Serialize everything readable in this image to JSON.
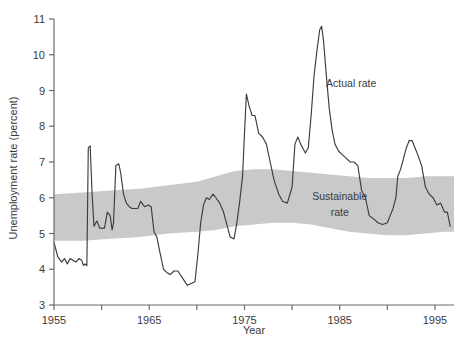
{
  "chart_data": {
    "type": "line",
    "title": "",
    "xlabel": "Year",
    "ylabel": "Unemployment rate (percent)",
    "xlim": [
      1955,
      1997
    ],
    "ylim": [
      3,
      11
    ],
    "xticks": [
      1955,
      1960,
      1965,
      1970,
      1975,
      1980,
      1985,
      1990,
      1995
    ],
    "xticklabels": [
      "1955",
      "",
      "1965",
      "",
      "1975",
      "",
      "1985",
      "",
      "1995"
    ],
    "yticks": [
      3,
      4,
      5,
      6,
      7,
      8,
      9,
      10,
      11
    ],
    "yticklabels": [
      "3",
      "4",
      "5",
      "6",
      "7",
      "8",
      "9",
      "10",
      "11"
    ],
    "grid": false,
    "legend_position": "inline-annotations",
    "annotations": [
      {
        "name": "actual-rate-label",
        "text": "Actual rate",
        "x": 1986.2,
        "y": 9.1
      },
      {
        "name": "sustainable-rate-label-line1",
        "text": "Sustainable",
        "x": 1985.0,
        "y": 5.95
      },
      {
        "name": "sustainable-rate-label-line2",
        "text": "rate",
        "x": 1985.0,
        "y": 5.5
      }
    ],
    "colors": {
      "line": "#3c3c3c",
      "band": "#c9c9c9",
      "axis": "#6b6b6b",
      "text": "#3a3a3a",
      "background": "#ffffff"
    },
    "series": [
      {
        "name": "Actual rate",
        "type": "line",
        "x": [
          1955.0,
          1955.4,
          1955.8,
          1956.1,
          1956.4,
          1956.7,
          1957.0,
          1957.3,
          1957.6,
          1957.9,
          1958.1,
          1958.25,
          1958.45,
          1958.6,
          1958.8,
          1959.0,
          1959.2,
          1959.5,
          1959.8,
          1960.0,
          1960.3,
          1960.6,
          1960.9,
          1961.1,
          1961.25,
          1961.5,
          1961.8,
          1962.0,
          1962.3,
          1962.6,
          1962.9,
          1963.2,
          1963.5,
          1963.8,
          1964.1,
          1964.5,
          1964.9,
          1965.2,
          1965.5,
          1965.8,
          1966.1,
          1966.5,
          1966.9,
          1967.2,
          1967.6,
          1968.0,
          1968.5,
          1969.0,
          1969.4,
          1969.8,
          1970.1,
          1970.4,
          1970.7,
          1971.0,
          1971.3,
          1971.7,
          1972.0,
          1972.4,
          1972.8,
          1973.1,
          1973.5,
          1973.9,
          1974.2,
          1974.5,
          1974.8,
          1975.0,
          1975.2,
          1975.5,
          1975.8,
          1976.1,
          1976.5,
          1976.9,
          1977.3,
          1977.7,
          1978.1,
          1978.6,
          1979.0,
          1979.5,
          1980.0,
          1980.3,
          1980.6,
          1980.9,
          1981.1,
          1981.4,
          1981.7,
          1982.0,
          1982.3,
          1982.6,
          1982.9,
          1983.1,
          1983.3,
          1983.6,
          1983.9,
          1984.2,
          1984.5,
          1984.9,
          1985.3,
          1985.7,
          1986.1,
          1986.5,
          1986.9,
          1987.3,
          1987.7,
          1988.1,
          1988.6,
          1989.0,
          1989.5,
          1990.0,
          1990.3,
          1990.6,
          1990.9,
          1991.1,
          1991.4,
          1991.7,
          1992.0,
          1992.3,
          1992.6,
          1992.9,
          1993.2,
          1993.6,
          1994.0,
          1994.4,
          1994.8,
          1995.2,
          1995.6,
          1996.0,
          1996.3,
          1996.6
        ],
        "y": [
          4.75,
          4.35,
          4.2,
          4.3,
          4.15,
          4.3,
          4.25,
          4.2,
          4.3,
          4.25,
          4.1,
          4.15,
          4.1,
          7.4,
          7.45,
          6.1,
          5.2,
          5.35,
          5.15,
          5.15,
          5.15,
          5.6,
          5.5,
          5.1,
          5.3,
          6.9,
          6.95,
          6.7,
          6.1,
          5.85,
          5.75,
          5.7,
          5.7,
          5.7,
          5.9,
          5.75,
          5.8,
          5.75,
          5.05,
          4.9,
          4.5,
          4.0,
          3.9,
          3.85,
          3.95,
          3.95,
          3.75,
          3.55,
          3.6,
          3.65,
          4.4,
          5.3,
          5.8,
          6.0,
          5.95,
          6.1,
          6.0,
          5.85,
          5.6,
          5.3,
          4.9,
          4.85,
          5.3,
          5.9,
          6.6,
          7.8,
          8.9,
          8.55,
          8.3,
          8.3,
          7.8,
          7.7,
          7.5,
          7.0,
          6.5,
          6.1,
          5.9,
          5.85,
          6.3,
          7.5,
          7.7,
          7.5,
          7.4,
          7.25,
          7.4,
          8.3,
          9.4,
          10.1,
          10.7,
          10.8,
          10.4,
          9.4,
          8.5,
          7.9,
          7.5,
          7.3,
          7.2,
          7.1,
          7.0,
          7.0,
          6.9,
          6.2,
          6.0,
          5.5,
          5.4,
          5.3,
          5.25,
          5.3,
          5.5,
          5.7,
          6.0,
          6.6,
          6.8,
          7.1,
          7.4,
          7.6,
          7.6,
          7.4,
          7.2,
          6.9,
          6.3,
          6.1,
          6.0,
          5.8,
          5.85,
          5.6,
          5.6,
          5.2
        ]
      }
    ],
    "band": {
      "name": "Sustainable rate",
      "type": "area-band",
      "x": [
        1955,
        1958,
        1961,
        1964,
        1967,
        1970,
        1972,
        1974,
        1976,
        1978,
        1980,
        1982,
        1984,
        1986,
        1988,
        1990,
        1992,
        1994,
        1996,
        1997
      ],
      "upper": [
        6.1,
        6.15,
        6.2,
        6.25,
        6.35,
        6.45,
        6.6,
        6.75,
        6.8,
        6.8,
        6.75,
        6.7,
        6.65,
        6.6,
        6.55,
        6.55,
        6.55,
        6.6,
        6.6,
        6.6
      ],
      "lower": [
        4.8,
        4.8,
        4.85,
        4.9,
        5.0,
        5.05,
        5.1,
        5.2,
        5.25,
        5.3,
        5.3,
        5.25,
        5.15,
        5.05,
        5.0,
        4.95,
        4.95,
        5.0,
        5.05,
        5.05
      ]
    }
  }
}
